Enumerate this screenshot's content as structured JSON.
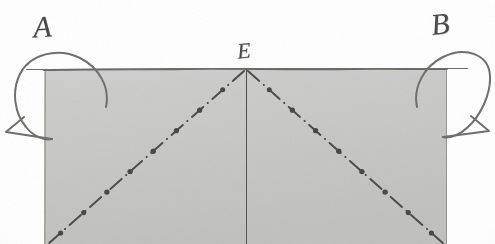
{
  "figure": {
    "kind": "scanned-geometry-diagram",
    "width": 495,
    "height": 244,
    "background_color": "#ffffff",
    "ink_color": "#4a4a4a"
  },
  "labels": {
    "left_corner": "A",
    "apex": "E",
    "right_corner": "B"
  },
  "shaded_region": {
    "shape": "rectangle",
    "fill_color": "#c9c9c7",
    "border_color": "#6d6d6b",
    "left": 44,
    "top": 69,
    "right": 447,
    "bottom": 244
  },
  "lines": {
    "vertical_axis": {
      "style": "solid",
      "color": "#4d4d4d",
      "from_x": 246,
      "from_y": 69,
      "to_x": 246,
      "to_y": 244
    },
    "left_diagonal": {
      "style": "dash-dot",
      "color": "#4d4d4d",
      "from_x": 246,
      "from_y": 69,
      "to_x": 48,
      "to_y": 244
    },
    "right_diagonal": {
      "style": "dash-dot",
      "color": "#4d4d4d",
      "from_x": 246,
      "from_y": 69,
      "to_x": 444,
      "to_y": 244
    }
  },
  "corner_ticks": {
    "left": {
      "from_x": 27,
      "to_x": 46,
      "y": 69
    },
    "right": {
      "from_x": 445,
      "to_x": 466,
      "y": 69
    }
  },
  "rotation_arrows": {
    "left": {
      "name": "curved-rotation-arrow-left",
      "direction": "counterclockwise",
      "anchor_x": 46,
      "anchor_y": 69
    },
    "right": {
      "name": "curved-rotation-arrow-right",
      "direction": "clockwise",
      "anchor_x": 445,
      "anchor_y": 69
    }
  }
}
